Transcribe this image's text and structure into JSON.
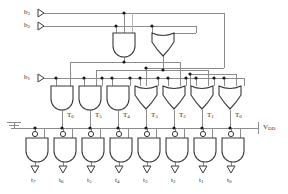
{
  "diagram": {
    "type": "digital-logic-circuit"
  },
  "inputs": [
    {
      "id": "b3",
      "label": "b",
      "sub": "3",
      "x": 30,
      "y": 13,
      "symbol": "buffer-triangle"
    },
    {
      "id": "b2",
      "label": "b",
      "sub": "2",
      "x": 30,
      "y": 26,
      "symbol": "buffer-triangle"
    },
    {
      "id": "b1",
      "label": "b",
      "sub": "1",
      "x": 30,
      "y": 78,
      "symbol": "buffer-triangle"
    }
  ],
  "top_gates": [
    {
      "id": "and-top",
      "type": "and",
      "cx": 124,
      "cy": 44
    },
    {
      "id": "xor-top",
      "type": "xor",
      "cx": 163,
      "cy": 44
    }
  ],
  "t_gates": [
    {
      "id": "T6",
      "label": "T",
      "sub": "6",
      "type": "and",
      "cx": 62,
      "label_x": 69,
      "label_y": 115
    },
    {
      "id": "T5",
      "label": "T",
      "sub": "5",
      "type": "and",
      "cx": 90,
      "label_x": 97,
      "label_y": 115
    },
    {
      "id": "T4",
      "label": "T",
      "sub": "4",
      "type": "and",
      "cx": 118,
      "label_x": 125,
      "label_y": 115
    },
    {
      "id": "T3",
      "label": "T",
      "sub": "3",
      "type": "xor",
      "cx": 146,
      "label_x": 152,
      "label_y": 115
    },
    {
      "id": "T2",
      "label": "T",
      "sub": "2",
      "type": "xor",
      "cx": 174,
      "label_x": 181,
      "label_y": 115
    },
    {
      "id": "T1",
      "label": "T",
      "sub": "1",
      "type": "xor",
      "cx": 202,
      "label_x": 209,
      "label_y": 115
    },
    {
      "id": "T0",
      "label": "T",
      "sub": "0",
      "type": "xor",
      "cx": 230,
      "label_x": 237,
      "label_y": 115
    }
  ],
  "output_gates": [
    {
      "id": "t7",
      "label": "t",
      "sub": "7",
      "type": "nand",
      "cx": 35,
      "bubble": true
    },
    {
      "id": "t6",
      "label": "t",
      "sub": "6",
      "type": "nand",
      "cx": 63,
      "bubble": true
    },
    {
      "id": "t5",
      "label": "t",
      "sub": "5",
      "type": "nand",
      "cx": 91,
      "bubble": true
    },
    {
      "id": "t4",
      "label": "t",
      "sub": "4",
      "type": "nand",
      "cx": 119,
      "bubble": true
    },
    {
      "id": "t3",
      "label": "t",
      "sub": "3",
      "type": "nand",
      "cx": 147,
      "bubble": true
    },
    {
      "id": "t2",
      "label": "t",
      "sub": "2",
      "type": "nand",
      "cx": 175,
      "bubble": true
    },
    {
      "id": "t1",
      "label": "t",
      "sub": "1",
      "type": "nand",
      "cx": 203,
      "bubble": true
    },
    {
      "id": "t0",
      "label": "t",
      "sub": "0",
      "type": "nand",
      "cx": 231,
      "bubble": true
    }
  ],
  "power": {
    "vdd_label": "V",
    "vdd_sub": "DD",
    "vdd_x": 264,
    "vdd_y": 126,
    "ground_x": 14,
    "ground_y": 128
  },
  "colors": {
    "wire": "#8c8c8c",
    "gate_outline": "#3a3a3a",
    "node": "#1a1a1a",
    "text": "#2a2a2a",
    "background": "#ffffff"
  }
}
